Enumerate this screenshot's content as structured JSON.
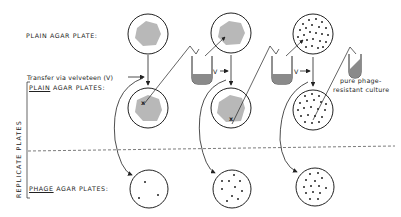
{
  "labels": {
    "plain_agar_plate": "PLAIN AGAR PLATE:",
    "transfer": "Transfer via velveteen (V)",
    "plain_underlined": "PLAIN",
    "plain_rest": " AGAR PLATES:",
    "phage_underlined": "PHAGE",
    "phage_rest": " AGAR PLATES:",
    "replicate_plates": "REPLICATE  PLATES",
    "v1": "V",
    "v2": "V",
    "pure_line1": "pure phage-",
    "pure_line2": "resistant culture",
    "x_mark_1": "x",
    "x_mark_2": "x"
  },
  "colors": {
    "ink": "#222222",
    "lawn": "#b8b8b8",
    "culture": "#8a8a8a"
  }
}
